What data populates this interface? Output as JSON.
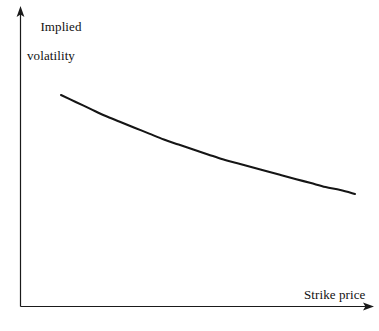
{
  "figure": {
    "background_color": "#ffffff",
    "line_color": "#151515",
    "axis_color": "#1a1a1a"
  },
  "axes": {
    "y_axis_label_line1": "Implied",
    "y_axis_label_line2": "volatility",
    "x_axis_label": "Strike price",
    "y_arrow_name": "y-axis-arrowhead",
    "x_arrow_name": "x-axis-arrowhead"
  },
  "chart_data": {
    "type": "line",
    "title": "",
    "subtitle": "",
    "xlabel": "Strike price",
    "ylabel": "Implied volatility",
    "grid": false,
    "legend": null,
    "annotations": [],
    "axis_ticks": {
      "x": [],
      "y": []
    },
    "xlim": [
      0,
      1
    ],
    "ylim": [
      0,
      1
    ],
    "series": [
      {
        "name": "implied volatility skew",
        "x": [
          0.0,
          0.05,
          0.1,
          0.15,
          0.2,
          0.25,
          0.3,
          0.35,
          0.4,
          0.45,
          0.5,
          0.55,
          0.6,
          0.65,
          0.7,
          0.75,
          0.8,
          0.85,
          0.9,
          0.95,
          1.0
        ],
        "y": [
          1.0,
          0.93,
          0.86,
          0.79,
          0.73,
          0.67,
          0.61,
          0.55,
          0.5,
          0.45,
          0.4,
          0.35,
          0.31,
          0.27,
          0.23,
          0.19,
          0.15,
          0.11,
          0.07,
          0.04,
          0.0
        ]
      }
    ]
  }
}
